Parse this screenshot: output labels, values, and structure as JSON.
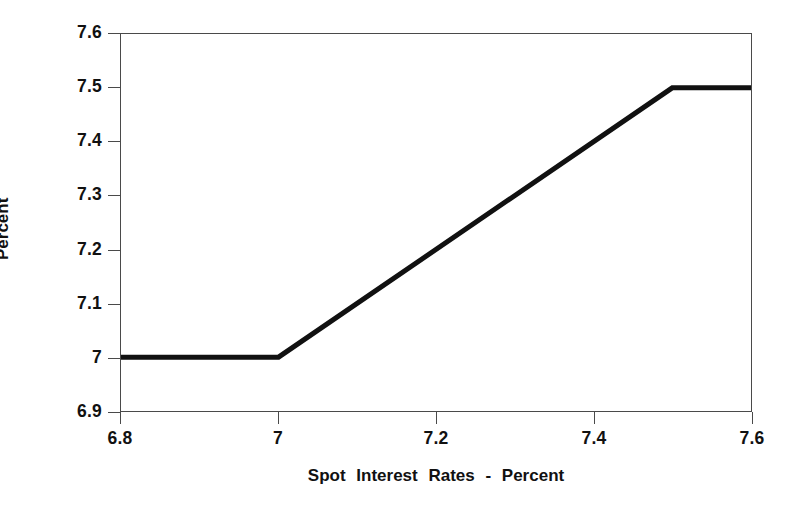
{
  "chart_data": {
    "type": "line",
    "title": "",
    "xlabel": "Spot Interest Rates - Percent",
    "ylabel": "Percent",
    "xlim": [
      6.8,
      7.6
    ],
    "ylim": [
      6.9,
      7.6
    ],
    "xticks": [
      6.8,
      7.0,
      7.2,
      7.4,
      7.6
    ],
    "xticklabels": [
      "6.8",
      "7",
      "7.2",
      "7.4",
      "7.6"
    ],
    "yticks": [
      6.9,
      7.0,
      7.1,
      7.2,
      7.3,
      7.4,
      7.5,
      7.6
    ],
    "yticklabels": [
      "6.9",
      "7",
      "7.1",
      "7.2",
      "7.3",
      "7.4",
      "7.5",
      "7.6"
    ],
    "grid": false,
    "legend": null,
    "series": [
      {
        "name": "payoff",
        "color": "#111111",
        "linewidth": 5,
        "x": [
          6.8,
          7.0,
          7.5,
          7.6
        ],
        "y": [
          7.0,
          7.0,
          7.5,
          7.5
        ]
      }
    ],
    "annotations": []
  },
  "axes": {
    "tick_direction": "out",
    "frame": "box",
    "frame_color": "#4a4a4a",
    "background": "#ffffff"
  }
}
